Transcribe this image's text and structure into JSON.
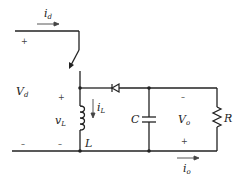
{
  "diagram": {
    "type": "buck-boost converter circuit",
    "labels": {
      "id": "i",
      "id_sub": "d",
      "Vd": "V",
      "Vd_sub": "d",
      "vL": "v",
      "vL_sub": "L",
      "iL": "i",
      "iL_sub": "L",
      "L": "L",
      "C": "C",
      "Vo": "V",
      "Vo_sub": "o",
      "R": "R",
      "io": "i",
      "io_sub": "o"
    },
    "signs": {
      "vd_plus": "+",
      "vd_minus": "–",
      "vl_plus": "+",
      "vl_minus": "–",
      "vo_minus": "–",
      "vo_plus": "+"
    },
    "components": [
      "switch",
      "inductor",
      "diode",
      "capacitor",
      "resistor"
    ]
  }
}
